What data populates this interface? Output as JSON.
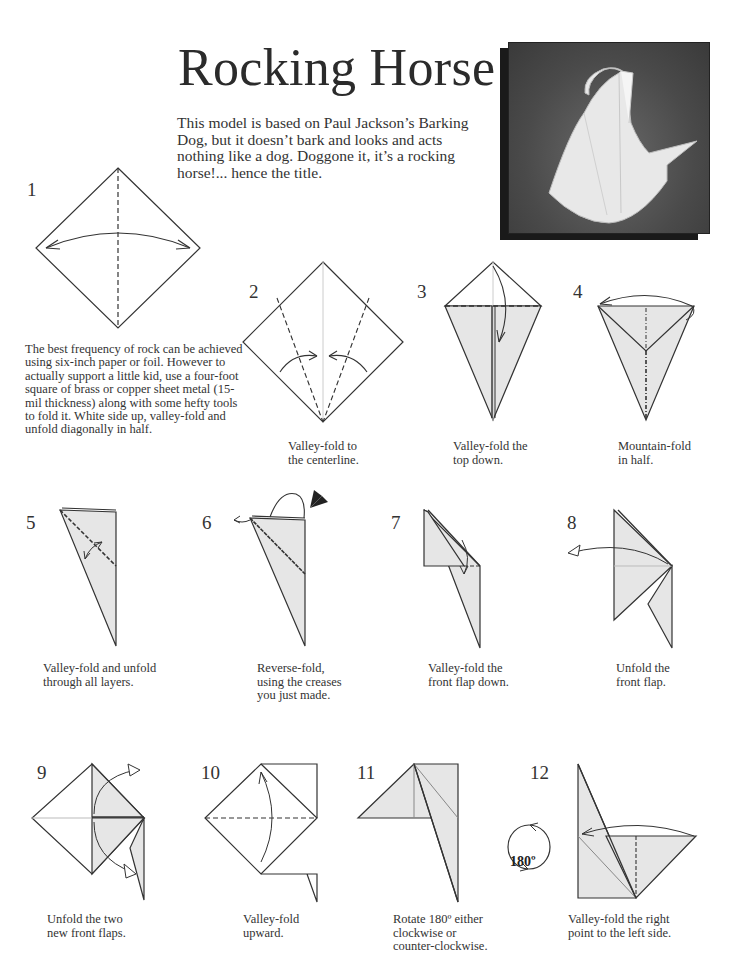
{
  "page": {
    "title": "Rocking Horse",
    "intro": "This model is based on Paul Jackson’s Barking Dog, but it doesn’t bark and looks and acts nothing like a dog.  Doggone it, it’s a rocking horse!... hence the title.",
    "photo_alt": "Photo of folded origami rocking horse"
  },
  "colors": {
    "paper_shade": "#e6e6e6",
    "line": "#333333",
    "photo_bg": "#4a4a4a"
  },
  "steps": [
    {
      "number": "1",
      "caption": "The best frequency of rock can be achieved using six-inch paper or foil. However to actually support a little kid, use a four-foot square of brass or copper sheet metal (15-mil thickness) along with some hefty tools to fold it. White side up, valley-fold and unfold diagonally in half."
    },
    {
      "number": "2",
      "caption_lines": [
        "Valley-fold to",
        "the centerline."
      ]
    },
    {
      "number": "3",
      "caption_lines": [
        "Valley-fold the",
        "top down."
      ]
    },
    {
      "number": "4",
      "caption_lines": [
        "Mountain-fold",
        "in half."
      ]
    },
    {
      "number": "5",
      "caption_lines": [
        "Valley-fold and unfold",
        "through all layers."
      ]
    },
    {
      "number": "6",
      "caption_lines": [
        "Reverse-fold,",
        "using the creases",
        "you just made."
      ]
    },
    {
      "number": "7",
      "caption_lines": [
        "Valley-fold the",
        "front flap down."
      ]
    },
    {
      "number": "8",
      "caption_lines": [
        "Unfold the",
        "front flap."
      ]
    },
    {
      "number": "9",
      "caption_lines": [
        "Unfold the two",
        "new front flaps."
      ]
    },
    {
      "number": "10",
      "caption_lines": [
        "Valley-fold",
        "upward."
      ]
    },
    {
      "number": "11",
      "caption_lines": [
        "Rotate 180º either",
        "clockwise or",
        "counter-clockwise."
      ]
    },
    {
      "number": "12",
      "caption_lines": [
        "Valley-fold the right",
        "point to the left side."
      ]
    }
  ],
  "rotate_badge": "180º"
}
